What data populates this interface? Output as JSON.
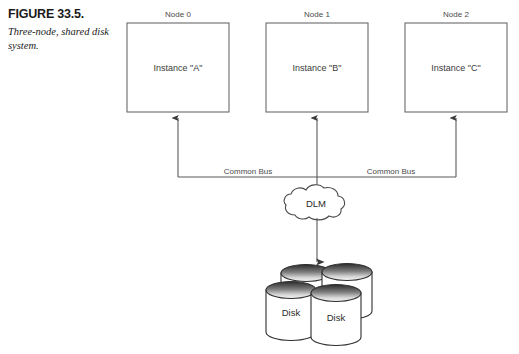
{
  "figure": {
    "number_label": "FIGURE 33.5.",
    "description": "Three-node, shared disk system."
  },
  "nodes": [
    {
      "node_label": "Node 0",
      "instance_label": "Instance \"A\""
    },
    {
      "node_label": "Node 1",
      "instance_label": "Instance \"B\""
    },
    {
      "node_label": "Node 2",
      "instance_label": "Instance \"C\""
    }
  ],
  "bus": {
    "left_label": "Common Bus",
    "right_label": "Common Bus"
  },
  "lock_manager": {
    "label": "DLM"
  },
  "storage": {
    "disks": [
      {
        "label": ""
      },
      {
        "label": ""
      },
      {
        "label": "Disk"
      },
      {
        "label": "Disk"
      }
    ],
    "front_left_label": "Disk",
    "front_right_label": "Disk"
  },
  "colors": {
    "background": "#ffffff",
    "box_stroke": "#6a6a6a",
    "wire_stroke": "#5a5a5a",
    "disk_stroke": "#2e2e2e",
    "text": "#3a3a3a",
    "caption_text": "#1a1a1a",
    "disk_top_dark": "#2b2b2b",
    "disk_top_light": "#f2f2f2"
  }
}
